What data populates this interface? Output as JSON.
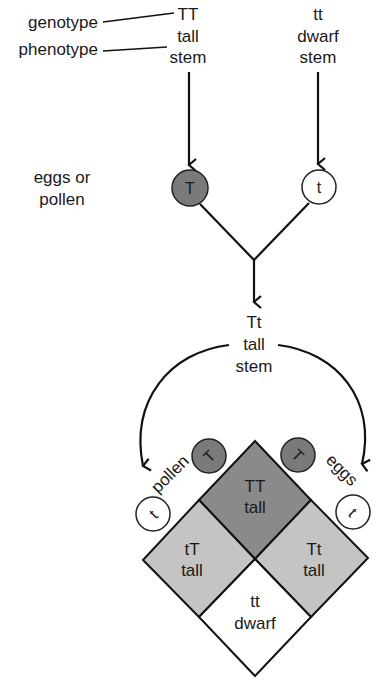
{
  "legend": {
    "genotype_label": "genotype",
    "phenotype_label": "phenotype",
    "gamete_label_line1": "eggs or",
    "gamete_label_line2": "pollen"
  },
  "parents": [
    {
      "genotype": "TT",
      "phenotype_line1": "tall",
      "phenotype_line2": "stem",
      "gamete": "T",
      "gamete_fill": "#7a7a7a"
    },
    {
      "genotype": "tt",
      "phenotype_line1": "dwarf",
      "phenotype_line2": "stem",
      "gamete": "t",
      "gamete_fill": "#ffffff"
    }
  ],
  "offspring": {
    "genotype": "Tt",
    "phenotype_line1": "tall",
    "phenotype_line2": "stem"
  },
  "cross": {
    "pollen_label": "pollen",
    "eggs_label": "eggs",
    "pollen_gametes": [
      "T",
      "t"
    ],
    "egg_gametes": [
      "T",
      "t"
    ],
    "cells": [
      {
        "position": "top",
        "genotype": "TT",
        "phenotype": "tall",
        "fill": "#8a8a8a"
      },
      {
        "position": "left",
        "genotype": "tT",
        "phenotype": "tall",
        "fill": "#c4c4c4"
      },
      {
        "position": "right",
        "genotype": "Tt",
        "phenotype": "tall",
        "fill": "#c4c4c4"
      },
      {
        "position": "bottom",
        "genotype": "tt",
        "phenotype": "dwarf",
        "fill": "#ffffff"
      }
    ]
  },
  "colors": {
    "line": "#111111",
    "dominant_gamete": "#7a7a7a",
    "recessive_gamete": "#ffffff",
    "homozygous_dominant_cell": "#8a8a8a",
    "heterozygous_cell": "#c4c4c4",
    "homozygous_recessive_cell": "#ffffff"
  }
}
